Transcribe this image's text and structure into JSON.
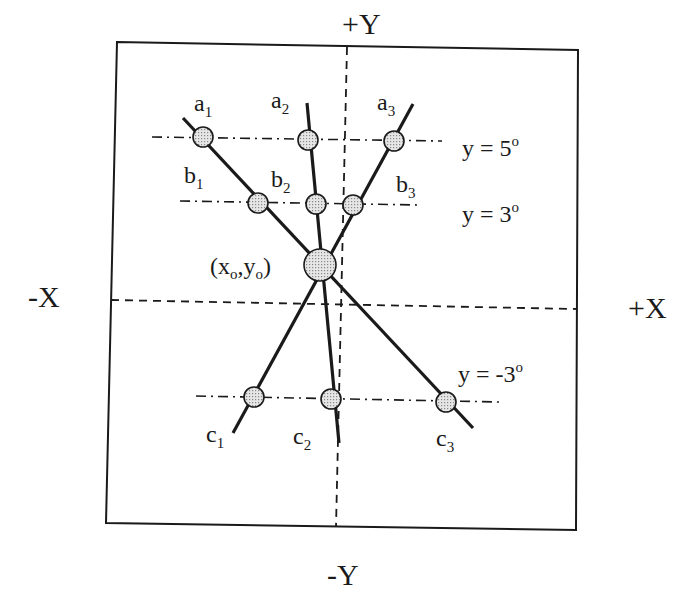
{
  "axes": {
    "pos_y": "+Y",
    "neg_y": "-Y",
    "neg_x": "-X",
    "pos_x": "+X"
  },
  "origin_label": {
    "open": "(x",
    "sub1": "o",
    "mid": ",y",
    "sub2": "o",
    "close": ")"
  },
  "reference_lines": [
    {
      "label": "y = 5",
      "deg": "o"
    },
    {
      "label": "y = 3",
      "deg": "o"
    },
    {
      "label": "y = -3",
      "deg": "o"
    }
  ],
  "points": {
    "a1": {
      "base": "a",
      "sub": "1"
    },
    "a2": {
      "base": "a",
      "sub": "2"
    },
    "a3": {
      "base": "a",
      "sub": "3"
    },
    "b1": {
      "base": "b",
      "sub": "1"
    },
    "b2": {
      "base": "b",
      "sub": "2"
    },
    "b3": {
      "base": "b",
      "sub": "3"
    },
    "c1": {
      "base": "c",
      "sub": "1"
    },
    "c2": {
      "base": "c",
      "sub": "2"
    },
    "c3": {
      "base": "c",
      "sub": "3"
    }
  },
  "colors": {
    "line": "#1a1a1a",
    "marker_fill": "#d4d4d4"
  }
}
